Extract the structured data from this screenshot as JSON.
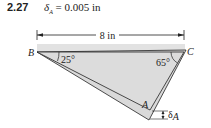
{
  "problem": {
    "number": "2.27",
    "given_symbol": "δ",
    "given_subscript": "A",
    "given_value": "= 0.005 in"
  },
  "diagram": {
    "dimension_label": "8 in",
    "points": {
      "B": "B",
      "C": "C",
      "A": "A"
    },
    "angles": {
      "at_B": "25°",
      "at_C": "65°"
    },
    "displacement_label": "δ",
    "displacement_subscript": "A",
    "colors": {
      "fill": "#d6d6d6",
      "line": "#222222",
      "band": "#e2e2e2"
    }
  }
}
